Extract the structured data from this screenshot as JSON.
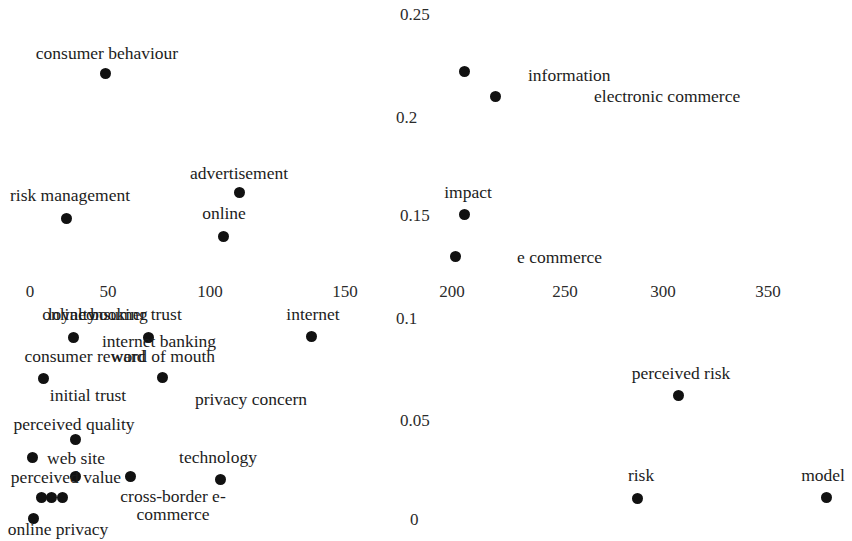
{
  "chart_data": {
    "type": "scatter",
    "title": "",
    "xlabel": "",
    "ylabel": "",
    "xlim": [
      -15,
      390
    ],
    "ylim": [
      0,
      0.2575
    ],
    "grid": false,
    "legend": null,
    "marker_color": "#111111",
    "x_ticks": [
      "0",
      "50",
      "100",
      "150",
      "200",
      "250",
      "300",
      "350"
    ],
    "x_tick_values": [
      0,
      50,
      100,
      150,
      200,
      250,
      300,
      350
    ],
    "y_ticks": [
      "0.25",
      "0.2",
      "0.15",
      "0.1",
      "0.05",
      "0"
    ],
    "y_tick_values": [
      0.25,
      0.2,
      0.15,
      0.1,
      0.05,
      0
    ],
    "points": [
      {
        "label": "consumer behaviour",
        "x": 37,
        "y": 0.2255,
        "px": 105,
        "py": 73,
        "lx": 107,
        "ly": 44,
        "align": "center"
      },
      {
        "label": "information",
        "x": 205,
        "y": 0.2215,
        "px": 464,
        "py": 71,
        "lx": 528,
        "ly": 66,
        "align": "left"
      },
      {
        "label": "electronic commerce",
        "x": 217,
        "y": 0.2125,
        "px": 495,
        "py": 96,
        "lx": 594,
        "ly": 87,
        "align": "left"
      },
      {
        "label": "advertisement",
        "x": 95,
        "y": 0.1585,
        "px": 239,
        "py": 192,
        "lx": 239,
        "ly": 164,
        "align": "center"
      },
      {
        "label": "impact",
        "x": 205,
        "y": 0.1495,
        "px": 464,
        "py": 214,
        "lx": 468,
        "ly": 183,
        "align": "center"
      },
      {
        "label": "risk management",
        "x": 19,
        "y": 0.1455,
        "px": 66,
        "py": 218,
        "lx": 70,
        "ly": 186,
        "align": "center"
      },
      {
        "label": "online",
        "x": 93,
        "y": 0.1385,
        "px": 223,
        "py": 236,
        "lx": 224,
        "ly": 204,
        "align": "center"
      },
      {
        "label": "e commerce",
        "x": 200,
        "y": 0.1305,
        "px": 455,
        "py": 256,
        "lx": 517,
        "ly": 248,
        "align": "left"
      },
      {
        "label": "internet",
        "x": 135,
        "y": 0.1065,
        "px": 311,
        "py": 336,
        "lx": 313,
        "ly": 305,
        "align": "center"
      },
      {
        "label": "loyalty",
        "x": 19,
        "y": 0.1055,
        "px": 73,
        "py": 337,
        "lx": 72,
        "ly": 305,
        "align": "center"
      },
      {
        "label": "online booking",
        "x": 19,
        "y": 0.1055,
        "px": 73,
        "py": 337,
        "lx": 95,
        "ly": 305,
        "align": "center"
      },
      {
        "label": "internet banking",
        "x": 52,
        "y": 0.1055,
        "px": 148,
        "py": 337,
        "lx": 159,
        "ly": 332,
        "align": "center"
      },
      {
        "label": "consumer trust",
        "x": 52,
        "y": 0.1055,
        "px": 148,
        "py": 337,
        "lx": 130,
        "ly": 305,
        "align": "center"
      },
      {
        "label": "consumer reward",
        "x": 8,
        "y": 0.0915,
        "px": 43,
        "py": 378,
        "lx": 85,
        "ly": 347,
        "align": "center"
      },
      {
        "label": "word of mouth",
        "x": 58,
        "y": 0.0915,
        "px": 162,
        "py": 377,
        "lx": 163,
        "ly": 347,
        "align": "center"
      },
      {
        "label": "initial trust",
        "x": 8,
        "y": 0.0915,
        "px": 43,
        "py": 378,
        "lx": 88,
        "ly": 386,
        "align": "center"
      },
      {
        "label": "privacy concern",
        "x": 58,
        "y": 0.0915,
        "px": 162,
        "py": 377,
        "lx": 251,
        "ly": 390,
        "align": "center"
      },
      {
        "label": "perceived risk",
        "x": 305,
        "y": 0.0625,
        "px": 678,
        "py": 395,
        "lx": 681,
        "ly": 364,
        "align": "center"
      },
      {
        "label": "perceived quality",
        "x": 22,
        "y": 0.0535,
        "px": 75,
        "py": 439,
        "lx": 74,
        "ly": 415,
        "align": "center"
      },
      {
        "label": "web site",
        "x": 5,
        "y": 0.0465,
        "px": 32,
        "py": 457,
        "lx": 76,
        "ly": 449,
        "align": "center"
      },
      {
        "label": "technology",
        "x": 90,
        "y": 0.0435,
        "px": 220,
        "py": 479,
        "lx": 218,
        "ly": 448,
        "align": "center"
      },
      {
        "label": "perceived value",
        "x": 22,
        "y": 0.0405,
        "px": 75,
        "py": 476,
        "lx": 66,
        "ly": 468,
        "align": "center"
      },
      {
        "label": "risk",
        "x": 290,
        "y": 0.0105,
        "px": 637,
        "py": 498,
        "lx": 641,
        "ly": 466,
        "align": "center"
      },
      {
        "label": "model",
        "x": 374,
        "y": 0.0105,
        "px": 826,
        "py": 497,
        "lx": 823,
        "ly": 466,
        "align": "center"
      },
      {
        "label": "cross-border e-commerce",
        "x": 5,
        "y": 0.0115,
        "px": 50,
        "py": 497,
        "lx": 173,
        "ly": 487,
        "align": "center"
      },
      {
        "label": "online privacy",
        "x": 2,
        "y": 0.0055,
        "px": 33,
        "py": 518,
        "lx": 58,
        "ly": 520,
        "align": "center"
      }
    ],
    "markers": [
      {
        "px": 105,
        "py": 73
      },
      {
        "px": 464,
        "py": 71
      },
      {
        "px": 495,
        "py": 96
      },
      {
        "px": 239,
        "py": 192
      },
      {
        "px": 464,
        "py": 214
      },
      {
        "px": 66,
        "py": 218
      },
      {
        "px": 223,
        "py": 236
      },
      {
        "px": 455,
        "py": 256
      },
      {
        "px": 311,
        "py": 336
      },
      {
        "px": 73,
        "py": 337
      },
      {
        "px": 148,
        "py": 337
      },
      {
        "px": 43,
        "py": 378
      },
      {
        "px": 162,
        "py": 377
      },
      {
        "px": 678,
        "py": 395
      },
      {
        "px": 75,
        "py": 439
      },
      {
        "px": 32,
        "py": 457
      },
      {
        "px": 220,
        "py": 479
      },
      {
        "px": 75,
        "py": 476
      },
      {
        "px": 130,
        "py": 476
      },
      {
        "px": 41,
        "py": 497
      },
      {
        "px": 51,
        "py": 497
      },
      {
        "px": 62,
        "py": 497
      },
      {
        "px": 33,
        "py": 518
      },
      {
        "px": 637,
        "py": 498
      },
      {
        "px": 826,
        "py": 497
      }
    ],
    "x_tick_px": [
      30,
      108,
      210,
      345,
      452,
      565,
      663,
      768
    ],
    "y_tick_px": [
      14,
      117,
      215,
      318,
      420,
      519
    ],
    "y_tick_label_x": [
      400,
      396,
      400,
      396,
      400,
      410
    ]
  }
}
